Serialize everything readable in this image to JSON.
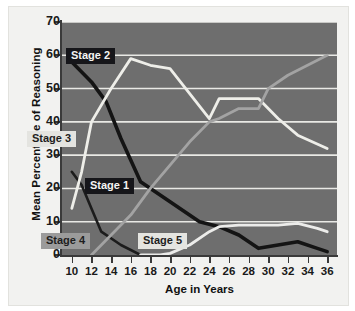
{
  "chart_data": {
    "type": "line",
    "title": "",
    "xlabel": "Age in Years",
    "ylabel": "Mean Percentage of Reasoning",
    "xlim": [
      9,
      37
    ],
    "ylim": [
      0,
      70
    ],
    "grid": true,
    "legend_position": "inline-labels",
    "x_ticks": [
      "10",
      "12",
      "14",
      "16",
      "18",
      "20",
      "22",
      "24",
      "26",
      "28",
      "30",
      "32",
      "34",
      "36"
    ],
    "y_ticks": [
      "0",
      "10",
      "20",
      "30",
      "40",
      "50",
      "60",
      "70"
    ],
    "series": [
      {
        "name": "Stage 1",
        "color": "#1c1c1c",
        "label_style": "dark",
        "x": [
          10,
          11,
          12,
          13,
          15,
          17
        ],
        "values": [
          25,
          21,
          14,
          7,
          3,
          0
        ]
      },
      {
        "name": "Stage 2",
        "color": "#141414",
        "label_style": "dark",
        "x": [
          10,
          12,
          13.5,
          15,
          17,
          20,
          23,
          25,
          27,
          29,
          31,
          33,
          35,
          36
        ],
        "values": [
          58,
          52,
          46,
          35,
          22,
          16,
          10,
          8.5,
          6,
          2,
          3,
          4,
          2,
          1
        ]
      },
      {
        "name": "Stage 3",
        "color": "#eeeee9",
        "label_style": "light",
        "x": [
          10,
          11,
          12,
          14,
          16,
          18,
          20,
          24,
          25,
          27,
          29,
          31,
          33,
          36
        ],
        "values": [
          14,
          25,
          40,
          50,
          59,
          57,
          56,
          41,
          47,
          47,
          47,
          41,
          36,
          32
        ]
      },
      {
        "name": "Stage 4",
        "color": "#a3a3a3",
        "label_style": "gray",
        "x": [
          12,
          14,
          16,
          18,
          20,
          22,
          24,
          25,
          27,
          29,
          30,
          32,
          34,
          36
        ],
        "values": [
          0,
          6,
          12,
          20,
          27,
          34,
          40,
          41,
          44,
          44,
          50,
          54,
          57,
          60
        ]
      },
      {
        "name": "Stage 5",
        "color": "#ececea",
        "label_style": "light",
        "x": [
          17,
          19,
          20,
          22,
          24,
          25,
          27,
          29,
          31,
          33,
          35,
          36
        ],
        "values": [
          0,
          0,
          0.5,
          3,
          7,
          8.5,
          9,
          9,
          9,
          9.5,
          8,
          7
        ]
      }
    ],
    "series_label_positions": [
      {
        "name": "Stage 1",
        "left": 85,
        "top": 178
      },
      {
        "name": "Stage 2",
        "left": 66,
        "top": 48
      },
      {
        "name": "Stage 3",
        "left": 27,
        "top": 131
      },
      {
        "name": "Stage 4",
        "left": 41,
        "top": 233
      },
      {
        "name": "Stage 5",
        "left": 138,
        "top": 233
      }
    ]
  }
}
